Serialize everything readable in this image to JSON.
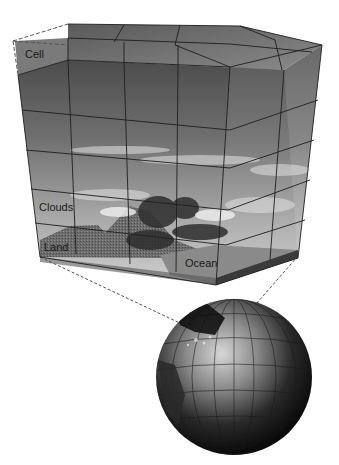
{
  "figure": {
    "type": "climate-model-grid-diagram",
    "labels": {
      "cell": "Cell",
      "clouds": "Clouds",
      "land": "Land",
      "ocean": "Ocean"
    },
    "components": [
      "grid block of atmospheric cells",
      "cut-out cell outlined with dashed line",
      "cloud and mountain landscape on block front",
      "ocean surface layer",
      "globe with latitude/longitude grid",
      "dashed projection lines from block to globe"
    ],
    "colors": {
      "background": "#ffffff",
      "grid_line": "#1e1e1e",
      "block_top": "#6e6e6e",
      "block_dark": "#4a4a4a",
      "sky_light": "#c8c8c8",
      "land": "#6a6a6a",
      "ocean": "#8a8a8a",
      "globe_dark": "#0e0e0e",
      "globe_light": "#d0d0d0",
      "dashed_line": "#555555"
    }
  }
}
